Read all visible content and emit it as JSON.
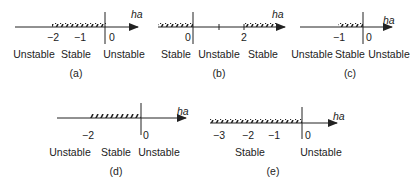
{
  "axis_label": "ha",
  "panels": [
    {
      "caption": "(a)",
      "ticks": [
        "−2",
        "−1",
        "0"
      ],
      "regions": [
        "Unstable",
        "Stable",
        "Unstable"
      ]
    },
    {
      "caption": "(b)",
      "ticks": [
        "0",
        "2"
      ],
      "regions": [
        "Stable",
        "Unstable",
        "Stable"
      ]
    },
    {
      "caption": "(c)",
      "ticks": [
        "−1",
        "0"
      ],
      "regions": [
        "Unstable",
        "Stable",
        "Unstable"
      ]
    },
    {
      "caption": "(d)",
      "ticks": [
        "−2",
        "0"
      ],
      "regions": [
        "Unstable",
        "Stable",
        "Unstable"
      ]
    },
    {
      "caption": "(e)",
      "ticks": [
        "−3",
        "−2",
        "−1",
        "0"
      ],
      "regions": [
        "Stable",
        "Unstable"
      ]
    }
  ]
}
